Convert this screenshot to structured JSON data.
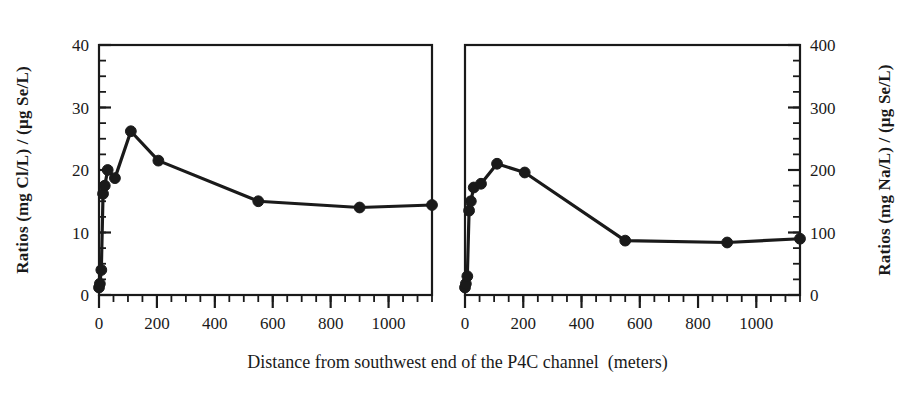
{
  "figure": {
    "xlabel": "Distance from southwest end of the P4C channel  (meters)",
    "background": "#ffffff",
    "ink": "#1a1a1a"
  },
  "chart_data": [
    {
      "type": "line",
      "panel": "left",
      "title": "",
      "xlabel": "Distance from southwest end of the P4C channel  (meters)",
      "ylabel": "Ratios  (mg Cl/L) / (µg Se/L)",
      "ylabel_side": "left",
      "xlim": [
        0,
        1150
      ],
      "ylim": [
        0,
        40
      ],
      "xticks": [
        0,
        200,
        400,
        600,
        800,
        1000
      ],
      "yticks": [
        0,
        10,
        20,
        30,
        40
      ],
      "xtick_labels": [
        "0",
        "200",
        "400",
        "600",
        "800",
        "1000"
      ],
      "ytick_labels": [
        "0",
        "10",
        "20",
        "30",
        "40"
      ],
      "x_minor_step": 50,
      "y_minor_step": 2.5,
      "grid": false,
      "legend": "none",
      "marker": "filled-circle",
      "color": "#1a1a1a",
      "x": [
        0,
        3,
        8,
        14,
        20,
        30,
        55,
        110,
        205,
        550,
        900,
        1150
      ],
      "y": [
        1.2,
        1.8,
        4.0,
        16.2,
        17.5,
        20.0,
        18.7,
        26.2,
        21.5,
        15.0,
        14.0,
        14.4
      ]
    },
    {
      "type": "line",
      "panel": "right",
      "title": "",
      "xlabel": "Distance from southwest end of the P4C channel  (meters)",
      "ylabel": "Ratios  (mg Na/L) / (µg Se/L)",
      "ylabel_side": "right",
      "xlim": [
        0,
        1150
      ],
      "ylim": [
        0,
        400
      ],
      "xticks": [
        0,
        200,
        400,
        600,
        800,
        1000
      ],
      "yticks": [
        0,
        100,
        200,
        300,
        400
      ],
      "xtick_labels": [
        "0",
        "200",
        "400",
        "600",
        "800",
        "1000"
      ],
      "ytick_labels": [
        "0",
        "100",
        "200",
        "300",
        "400"
      ],
      "x_minor_step": 50,
      "y_minor_step": 25,
      "grid": false,
      "legend": "none",
      "marker": "filled-circle",
      "color": "#1a1a1a",
      "x": [
        0,
        3,
        8,
        14,
        20,
        30,
        55,
        110,
        205,
        550,
        900,
        1150
      ],
      "y": [
        12,
        18,
        30,
        135,
        150,
        172,
        178,
        210,
        196,
        87,
        84,
        90
      ]
    }
  ]
}
